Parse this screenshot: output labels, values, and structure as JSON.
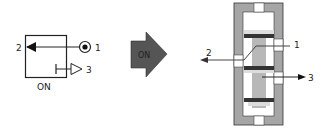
{
  "symbol": {
    "label": "ON",
    "ports": {
      "p1": "1",
      "p2": "2",
      "p3": "3"
    }
  },
  "arrow": {
    "label": "ON",
    "color": "#555555"
  },
  "valve": {
    "ports": {
      "p1": "1",
      "p2": "2",
      "p3": "3"
    },
    "body_color": "#a6a6a6",
    "seal_color": "#333333"
  }
}
